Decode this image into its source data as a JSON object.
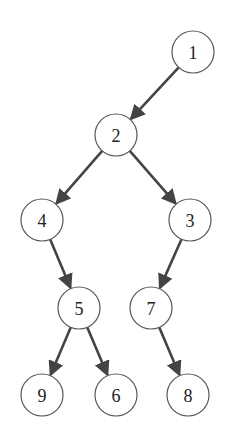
{
  "diagram": {
    "type": "binary-tree",
    "node_radius": 21,
    "colors": {
      "background": "#ffffff",
      "node_stroke": "#555555",
      "node_fill": "#ffffff",
      "edge": "#444444",
      "label": "#222222"
    },
    "nodes": [
      {
        "id": "1",
        "label": "1",
        "x": 193,
        "y": 52
      },
      {
        "id": "2",
        "label": "2",
        "x": 116,
        "y": 135
      },
      {
        "id": "4",
        "label": "4",
        "x": 42,
        "y": 220
      },
      {
        "id": "3",
        "label": "3",
        "x": 190,
        "y": 220
      },
      {
        "id": "5",
        "label": "5",
        "x": 79,
        "y": 308
      },
      {
        "id": "7",
        "label": "7",
        "x": 151,
        "y": 308
      },
      {
        "id": "9",
        "label": "9",
        "x": 42,
        "y": 395
      },
      {
        "id": "6",
        "label": "6",
        "x": 116,
        "y": 395
      },
      {
        "id": "8",
        "label": "8",
        "x": 188,
        "y": 395
      }
    ],
    "edges": [
      {
        "from": "1",
        "to": "2"
      },
      {
        "from": "2",
        "to": "4"
      },
      {
        "from": "2",
        "to": "3"
      },
      {
        "from": "4",
        "to": "5"
      },
      {
        "from": "3",
        "to": "7"
      },
      {
        "from": "5",
        "to": "9"
      },
      {
        "from": "5",
        "to": "6"
      },
      {
        "from": "7",
        "to": "8"
      }
    ]
  }
}
